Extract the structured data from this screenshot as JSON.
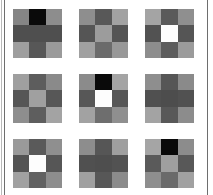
{
  "figure": {
    "rows": 3,
    "columns": 3,
    "patch_count": 9
  },
  "frame": {
    "left_rule_color": "#6e6e6e",
    "left_outer_rule_color": "#b9b9b9",
    "right_rule_color": "#6e6e6e",
    "background_color": "#ffffff"
  },
  "palette": {
    "black": "#0a0a0a",
    "dark": "#4f4f4f",
    "dark_alt": "#565656",
    "mid": "#7d7d7d",
    "mid_light": "#8c8c8c",
    "light": "#9e9e9e",
    "lighter": "#ababab",
    "white": "#fdfdfd"
  },
  "patches": [
    {
      "name": "patch-1",
      "position": "row1-col1",
      "cells": [
        "#858585",
        "#0a0a0a",
        "#8d8d8d",
        "#4f4f4f",
        "#4f4f4f",
        "#4f4f4f",
        "#9e9e9e",
        "#575757",
        "#9a9a9a"
      ]
    },
    {
      "name": "patch-2",
      "position": "row1-col2",
      "cells": [
        "#8e8e8e",
        "#585858",
        "#a2a2a2",
        "#555555",
        "#9c9c9c",
        "#545454",
        "#a0a0a0",
        "#6b6b6b",
        "#989898"
      ]
    },
    {
      "name": "patch-3",
      "position": "row1-col3",
      "cells": [
        "#a4a4a4",
        "#5a5a5a",
        "#8f8f8f",
        "#525252",
        "#fdfdfd",
        "#555555",
        "#8d8d8d",
        "#5c5c5c",
        "#9b9b9b"
      ]
    },
    {
      "name": "patch-4",
      "position": "row2-col1",
      "cells": [
        "#9f9f9f",
        "#5d5d5d",
        "#8a8a8a",
        "#565656",
        "#a0a0a0",
        "#575757",
        "#8e8e8e",
        "#5e5e5e",
        "#a3a3a3"
      ]
    },
    {
      "name": "patch-5",
      "position": "row2-col2",
      "cells": [
        "#8b8b8b",
        "#0a0a0a",
        "#a4a4a4",
        "#575757",
        "#fdfdfd",
        "#565656",
        "#a2a2a2",
        "#6e6e6e",
        "#8f8f8f"
      ]
    },
    {
      "name": "patch-6",
      "position": "row2-col3",
      "cells": [
        "#8e8e8e",
        "#565656",
        "#8a8a8a",
        "#505050",
        "#4d4d4d",
        "#515151",
        "#a3a3a3",
        "#585858",
        "#8c8c8c"
      ]
    },
    {
      "name": "patch-7",
      "position": "row3-col1",
      "cells": [
        "#9a9a9a",
        "#5a5a5a",
        "#8f8f8f",
        "#545454",
        "#fdfdfd",
        "#565656",
        "#a1a1a1",
        "#616161",
        "#8d8d8d"
      ]
    },
    {
      "name": "patch-8",
      "position": "row3-col2",
      "cells": [
        "#8d8d8d",
        "#565656",
        "#9f9f9f",
        "#505050",
        "#4e4e4e",
        "#525252",
        "#a0a0a0",
        "#575757",
        "#8b8b8b"
      ]
    },
    {
      "name": "patch-9",
      "position": "row3-col3",
      "cells": [
        "#a5a5a5",
        "#0a0a0a",
        "#8c8c8c",
        "#5a5a5a",
        "#9f9f9f",
        "#585858",
        "#8e8e8e",
        "#6a6a6a",
        "#a1a1a1"
      ]
    }
  ]
}
